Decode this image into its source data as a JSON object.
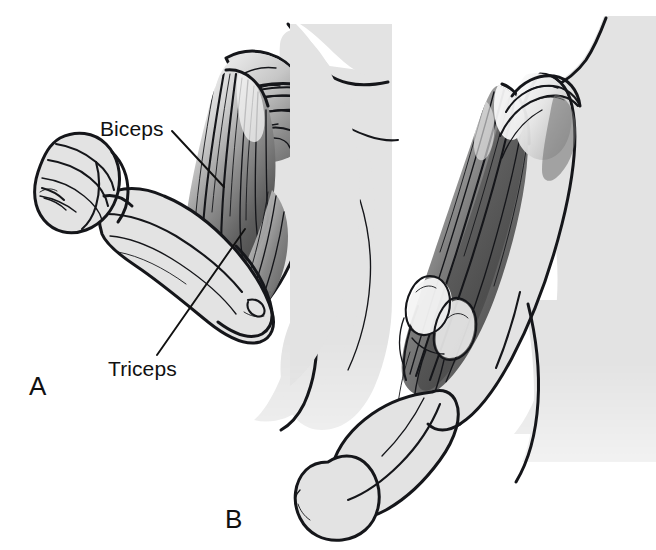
{
  "figure": {
    "background_color": "#ffffff",
    "ink_color": "#15161a",
    "skin_color": "#e3e3e3",
    "muscle_dark_color": "#5a5a5a",
    "muscle_mid_color": "#8d8d8d",
    "muscle_light_color": "#f2f2f2",
    "width": 656,
    "height": 550
  },
  "labels": {
    "biceps": "Biceps",
    "triceps": "Triceps"
  },
  "panels": [
    {
      "letter": "A",
      "description": "Flexed arm with clenched fist showing contracted biceps and relaxed triceps"
    },
    {
      "letter": "B",
      "description": "Extended arm showing contracted triceps and relaxed biceps"
    }
  ],
  "panel_letters": {
    "a": "A",
    "b": "B"
  }
}
